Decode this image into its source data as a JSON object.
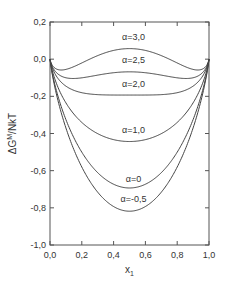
{
  "chart_data": {
    "type": "line",
    "title": "",
    "xlabel": "x",
    "xlabel_subscript": "1",
    "ylabel": "ΔG",
    "ylabel_superscript": "M",
    "ylabel_suffix": "/NkT",
    "xlim": [
      0.0,
      1.0
    ],
    "ylim": [
      -1.0,
      0.2
    ],
    "xticks": [
      "0,0",
      "0,2",
      "0,4",
      "0,6",
      "0,8",
      "1,0"
    ],
    "yticks": [
      "0,2",
      "0,0",
      "-0,2",
      "-0,4",
      "-0,6",
      "-0,8",
      "-1,0"
    ],
    "grid": false,
    "legend": "inline labels",
    "x": [
      0.0,
      0.05,
      0.1,
      0.2,
      0.3,
      0.4,
      0.5,
      0.6,
      0.7,
      0.8,
      0.9,
      0.95,
      1.0
    ],
    "series": [
      {
        "name": "α=3,0",
        "alpha": 3.0,
        "values": [
          0.0,
          -0.056,
          -0.055,
          0.0,
          0.019,
          0.047,
          0.057,
          0.047,
          0.019,
          0.0,
          -0.055,
          -0.056,
          0.0
        ]
      },
      {
        "name": "α=2,5",
        "alpha": 2.5,
        "values": [
          0.0,
          -0.08,
          -0.1,
          -0.08,
          -0.086,
          -0.073,
          -0.068,
          -0.073,
          -0.086,
          -0.08,
          -0.1,
          -0.08,
          0.0
        ]
      },
      {
        "name": "α=2,0",
        "alpha": 2.0,
        "values": [
          0.0,
          -0.104,
          -0.145,
          -0.18,
          -0.191,
          -0.193,
          -0.193,
          -0.193,
          -0.191,
          -0.18,
          -0.145,
          -0.104,
          0.0
        ]
      },
      {
        "name": "α=1,0",
        "alpha": 1.0,
        "values": [
          0.0,
          -0.151,
          -0.235,
          -0.34,
          -0.401,
          -0.433,
          -0.443,
          -0.433,
          -0.401,
          -0.34,
          -0.235,
          -0.151,
          0.0
        ]
      },
      {
        "name": "α=0",
        "alpha": 0.0,
        "values": [
          0.0,
          -0.199,
          -0.325,
          -0.5,
          -0.611,
          -0.673,
          -0.693,
          -0.673,
          -0.611,
          -0.5,
          -0.325,
          -0.199,
          0.0
        ]
      },
      {
        "name": "α=-0,5",
        "alpha": -0.5,
        "values": [
          0.0,
          -0.222,
          -0.37,
          -0.58,
          -0.716,
          -0.793,
          -0.818,
          -0.793,
          -0.716,
          -0.58,
          -0.37,
          -0.222,
          0.0
        ]
      }
    ]
  },
  "labels": {
    "curves": [
      "α=3,0",
      "α=2,5",
      "α=2,0",
      "α=1,0",
      "α=0",
      "α=-0,5"
    ]
  }
}
